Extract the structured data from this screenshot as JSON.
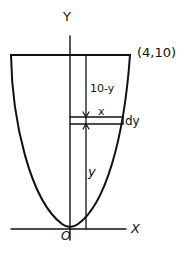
{
  "diagram": {
    "labels": {
      "y_axis": "Y",
      "x_axis": "X",
      "origin": "O",
      "corner_point": "(4,10)",
      "depth_above": "10-y",
      "strip_halfwidth": "x",
      "strip_thickness": "dy",
      "strip_height": "y"
    },
    "curve": "parabola through origin and (4,10)",
    "colors": {
      "stroke": "#111111",
      "background": "#ffffff"
    }
  }
}
